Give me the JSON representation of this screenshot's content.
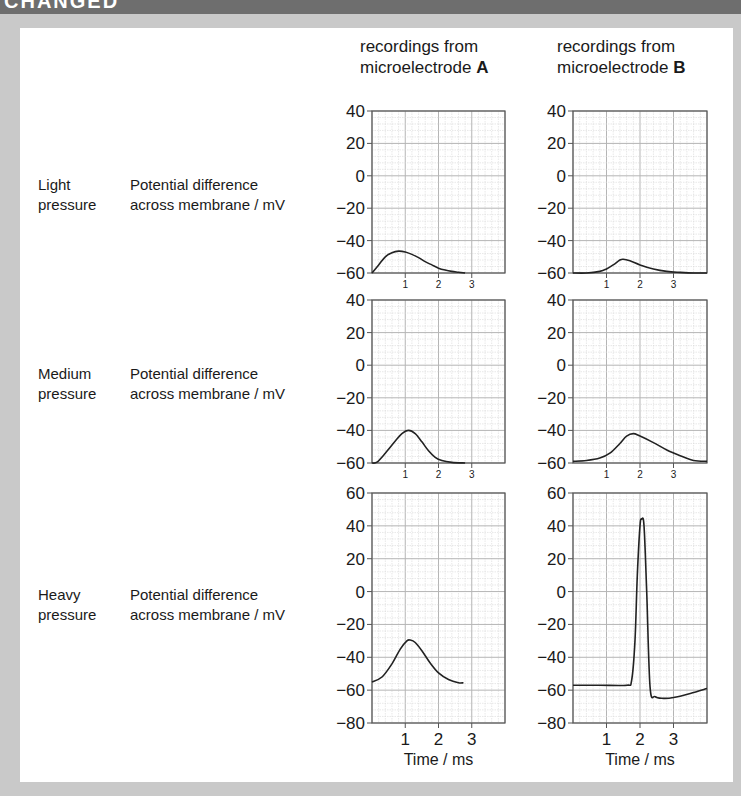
{
  "header": {
    "title_fragment": "CHANGED"
  },
  "columns": [
    {
      "line1": "recordings from",
      "line2_prefix": "microelectrode ",
      "line2_bold": "A"
    },
    {
      "line1": "recordings from",
      "line2_prefix": "microelectrode ",
      "line2_bold": "B"
    }
  ],
  "rows": [
    {
      "pressure_line1": "Light",
      "pressure_line2": "pressure",
      "ylabel_line1": "Potential difference",
      "ylabel_line2": "across membrane / mV"
    },
    {
      "pressure_line1": "Medium",
      "pressure_line2": "pressure",
      "ylabel_line1": "Potential difference",
      "ylabel_line2": "across membrane / mV"
    },
    {
      "pressure_line1": "Heavy",
      "pressure_line2": "pressure",
      "ylabel_line1": "Potential difference",
      "ylabel_line2": "across membrane / mV"
    }
  ],
  "xlabel": "Time / ms",
  "colors": {
    "line": "#222222",
    "grid_minor": "#d9d9d9",
    "grid_major": "#b5b5b5",
    "frame": "#555555",
    "background": "#c9c9c9",
    "panel": "#ffffff"
  },
  "chart_data": [
    {
      "type": "line",
      "title": "Light pressure – microelectrode A",
      "xlabel": "",
      "ylabel": "Potential difference across membrane / mV",
      "xlim": [
        0,
        4
      ],
      "ylim": [
        -60,
        40
      ],
      "yticks": [
        40,
        20,
        0,
        -20,
        -40,
        -60
      ],
      "xticks": [
        1,
        2,
        3
      ],
      "x": [
        0,
        0.2,
        0.4,
        0.6,
        0.8,
        1.0,
        1.2,
        1.4,
        1.6,
        1.8,
        2.0,
        2.2,
        2.4,
        2.6,
        2.8
      ],
      "y": [
        -60,
        -55,
        -50,
        -47.5,
        -46.5,
        -47,
        -48.5,
        -50.5,
        -53,
        -55,
        -57,
        -58.2,
        -59,
        -59.5,
        -60
      ]
    },
    {
      "type": "line",
      "title": "Light pressure – microelectrode B",
      "xlabel": "",
      "ylabel": "Potential difference across membrane / mV",
      "xlim": [
        0,
        4
      ],
      "ylim": [
        -60,
        40
      ],
      "yticks": [
        40,
        20,
        0,
        -20,
        -40,
        -60
      ],
      "xticks": [
        1,
        2,
        3
      ],
      "x": [
        0,
        0.4,
        0.8,
        1.0,
        1.2,
        1.4,
        1.5,
        1.7,
        2.0,
        2.4,
        2.8,
        3.2,
        3.6,
        4.0
      ],
      "y": [
        -60,
        -60,
        -59,
        -57.5,
        -55,
        -52,
        -51.5,
        -52.5,
        -55,
        -57.5,
        -59,
        -59.6,
        -60,
        -60
      ]
    },
    {
      "type": "line",
      "title": "Medium pressure – microelectrode A",
      "xlabel": "",
      "ylabel": "Potential difference across membrane / mV",
      "xlim": [
        0,
        4
      ],
      "ylim": [
        -60,
        40
      ],
      "yticks": [
        40,
        20,
        0,
        -20,
        -40,
        -60
      ],
      "xticks": [
        1,
        2,
        3
      ],
      "x": [
        0,
        0.15,
        0.4,
        0.7,
        0.9,
        1.1,
        1.3,
        1.5,
        1.7,
        1.9,
        2.1,
        2.4,
        2.8
      ],
      "y": [
        -60,
        -59.5,
        -54,
        -46.5,
        -42,
        -40,
        -42,
        -47,
        -52.5,
        -56.5,
        -58.5,
        -59.6,
        -60
      ]
    },
    {
      "type": "line",
      "title": "Medium pressure – microelectrode B",
      "xlabel": "",
      "ylabel": "Potential difference across membrane / mV",
      "xlim": [
        0,
        4
      ],
      "ylim": [
        -60,
        40
      ],
      "yticks": [
        40,
        20,
        0,
        -20,
        -40,
        -60
      ],
      "xticks": [
        1,
        2,
        3
      ],
      "x": [
        0,
        0.4,
        0.8,
        1.1,
        1.4,
        1.6,
        1.8,
        2.0,
        2.4,
        2.8,
        3.2,
        3.6,
        4.0
      ],
      "y": [
        -59,
        -58.5,
        -57,
        -54,
        -48,
        -43.5,
        -42,
        -43.5,
        -47.5,
        -52,
        -55.5,
        -58.5,
        -59
      ]
    },
    {
      "type": "line",
      "title": "Heavy pressure – microelectrode A",
      "xlabel": "Time / ms",
      "ylabel": "Potential difference across membrane / mV",
      "xlim": [
        0,
        4
      ],
      "ylim": [
        -80,
        60
      ],
      "yticks": [
        60,
        40,
        20,
        0,
        -20,
        -40,
        -60,
        -80
      ],
      "xticks": [
        1,
        2,
        3
      ],
      "x": [
        0,
        0.3,
        0.6,
        0.85,
        1.05,
        1.15,
        1.3,
        1.5,
        1.75,
        2.0,
        2.3,
        2.6,
        2.75
      ],
      "y": [
        -55,
        -52,
        -44,
        -35,
        -30,
        -29.5,
        -31,
        -36,
        -43.5,
        -49.5,
        -53.5,
        -55.5,
        -55.5
      ]
    },
    {
      "type": "line",
      "title": "Heavy pressure – microelectrode B",
      "xlabel": "Time / ms",
      "ylabel": "Potential difference across membrane / mV",
      "xlim": [
        0,
        4
      ],
      "ylim": [
        -80,
        60
      ],
      "yticks": [
        60,
        40,
        20,
        0,
        -20,
        -40,
        -60,
        -80
      ],
      "xticks": [
        1,
        2,
        3
      ],
      "x": [
        0,
        0.8,
        1.6,
        1.75,
        1.85,
        1.92,
        2.0,
        2.05,
        2.12,
        2.2,
        2.3,
        2.45,
        2.7,
        3.0,
        3.5,
        4.0
      ],
      "y": [
        -57,
        -57,
        -57,
        -54,
        -30,
        10,
        40,
        44,
        40,
        0,
        -58,
        -64,
        -65,
        -64.5,
        -62,
        -59
      ]
    }
  ]
}
